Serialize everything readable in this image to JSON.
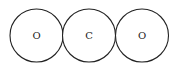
{
  "diagram": {
    "title": "",
    "atoms": [
      {
        "label": "O",
        "cx": 36.5,
        "cy": 35.5,
        "r": 26.5
      },
      {
        "label": "C",
        "cx": 89,
        "cy": 35.5,
        "r": 26.5
      },
      {
        "label": "O",
        "cx": 142,
        "cy": 35.5,
        "r": 26.5
      }
    ],
    "colors": {
      "stroke": "#222222",
      "background": "#ffffff"
    }
  }
}
